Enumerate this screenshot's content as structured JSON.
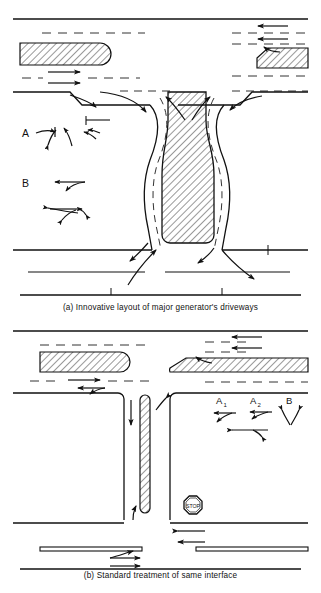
{
  "figure": {
    "type": "engineering-diagram",
    "background_color": "#ffffff",
    "ink_color": "#111111",
    "hatch_color": "#333333"
  },
  "panel_a": {
    "caption": "(a) Innovative layout of major generator's driveways",
    "movement_labels": [
      {
        "id": "A",
        "text": "A",
        "subscript": ""
      },
      {
        "id": "B",
        "text": "B",
        "subscript": ""
      }
    ],
    "islands": [
      {
        "name": "upper-left-median",
        "shape": "rounded-end-bar",
        "hatched": true
      },
      {
        "name": "upper-right-median",
        "shape": "chamfered-end-bar",
        "hatched": true
      },
      {
        "name": "central-hourglass-island",
        "shape": "hourglass",
        "hatched": true
      }
    ],
    "features": [
      "dashed lane lines",
      "curved channelized turn paths",
      "flared driveway throats",
      "directional flow arrows"
    ]
  },
  "panel_b": {
    "caption": "(b) Standard treatment of same interface",
    "movement_labels": [
      {
        "id": "A1",
        "text": "A",
        "subscript": "1"
      },
      {
        "id": "A2",
        "text": "A",
        "subscript": "2"
      },
      {
        "id": "B",
        "text": "B",
        "subscript": ""
      }
    ],
    "islands": [
      {
        "name": "upper-left-median",
        "shape": "rounded-end-bar",
        "hatched": true
      },
      {
        "name": "upper-right-median",
        "shape": "chamfered-end-bar",
        "hatched": true
      },
      {
        "name": "central-vertical-median",
        "shape": "narrow-rounded-bar",
        "hatched": true
      },
      {
        "name": "lower-left-median",
        "shape": "thin-bar",
        "hatched": false
      },
      {
        "name": "lower-right-median",
        "shape": "thin-bar",
        "hatched": false
      }
    ],
    "sign": {
      "name": "stop-sign",
      "shape": "octagon",
      "text": "STOP"
    },
    "features": [
      "right-angle intersection legs",
      "dashed lane lines",
      "pavement flow arrows"
    ]
  }
}
